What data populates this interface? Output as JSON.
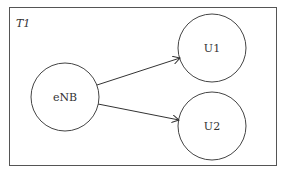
{
  "diagram": {
    "frame_label": "T1",
    "nodes": [
      {
        "id": "enb",
        "label": "eNB",
        "cx": 65,
        "cy": 97,
        "r": 34
      },
      {
        "id": "u1",
        "label": "U1",
        "cx": 212,
        "cy": 48,
        "r": 34
      },
      {
        "id": "u2",
        "label": "U2",
        "cx": 212,
        "cy": 126,
        "r": 34
      }
    ],
    "edges": [
      {
        "from": "eNB",
        "to": "U1"
      },
      {
        "from": "eNB",
        "to": "U2"
      }
    ],
    "colors": {
      "stroke": "#333333",
      "background": "#ffffff"
    }
  }
}
